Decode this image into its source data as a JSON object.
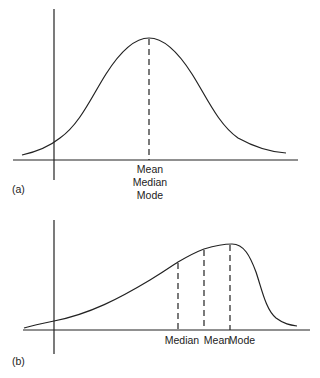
{
  "panels": [
    {
      "id": "a",
      "panel_label": "(a)",
      "description": "Symmetric distribution",
      "center_labels": [
        "Mean",
        "Median",
        "Mode"
      ]
    },
    {
      "id": "b",
      "panel_label": "(b)",
      "description": "Negatively skewed distribution",
      "marker_labels": [
        "Median",
        "Mean",
        "Mode"
      ]
    }
  ],
  "colors": {
    "line": "#222222",
    "background": "#ffffff"
  }
}
